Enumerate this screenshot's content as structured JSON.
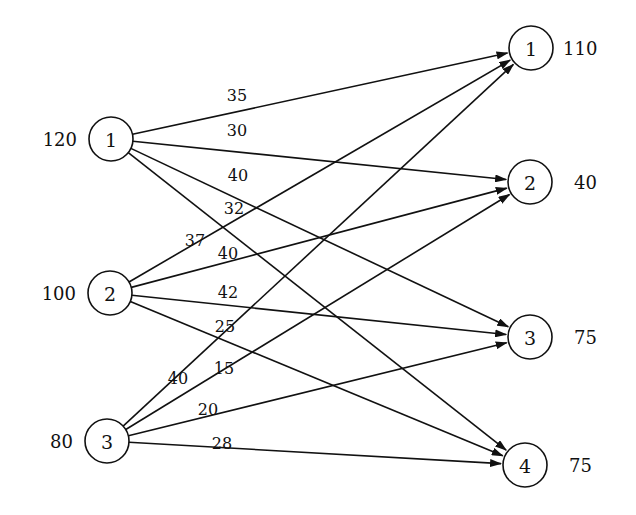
{
  "diagram": {
    "type": "transportation-network",
    "sources": [
      {
        "id": "1",
        "label": "1",
        "supply": "120",
        "x": 111,
        "y": 139
      },
      {
        "id": "2",
        "label": "2",
        "supply": "100",
        "x": 110,
        "y": 293
      },
      {
        "id": "3",
        "label": "3",
        "supply": "80",
        "x": 107,
        "y": 441
      }
    ],
    "destinations": [
      {
        "id": "1",
        "label": "1",
        "demand": "110",
        "x": 531,
        "y": 48
      },
      {
        "id": "2",
        "label": "2",
        "demand": "40",
        "x": 530,
        "y": 182
      },
      {
        "id": "3",
        "label": "3",
        "demand": "75",
        "x": 530,
        "y": 337
      },
      {
        "id": "4",
        "label": "4",
        "demand": "75",
        "x": 525,
        "y": 465
      }
    ],
    "edges": [
      {
        "from": "1",
        "to": "1",
        "cost": "35",
        "lx": 237,
        "ly": 101
      },
      {
        "from": "1",
        "to": "2",
        "cost": "30",
        "lx": 237,
        "ly": 136
      },
      {
        "from": "1",
        "to": "3",
        "cost": "40",
        "lx": 238,
        "ly": 181
      },
      {
        "from": "1",
        "to": "4",
        "cost": "32",
        "lx": 234,
        "ly": 214
      },
      {
        "from": "2",
        "to": "1",
        "cost": "37",
        "lx": 195,
        "ly": 246
      },
      {
        "from": "2",
        "to": "2",
        "cost": "40",
        "lx": 228,
        "ly": 259
      },
      {
        "from": "2",
        "to": "3",
        "cost": "42",
        "lx": 228,
        "ly": 298
      },
      {
        "from": "2",
        "to": "4",
        "cost": "25",
        "lx": 225,
        "ly": 332
      },
      {
        "from": "3",
        "to": "1",
        "cost": "40",
        "lx": 178,
        "ly": 384
      },
      {
        "from": "3",
        "to": "2",
        "cost": "15",
        "lx": 224,
        "ly": 374
      },
      {
        "from": "3",
        "to": "3",
        "cost": "20",
        "lx": 208,
        "ly": 415
      },
      {
        "from": "3",
        "to": "4",
        "cost": "28",
        "lx": 222,
        "ly": 449
      }
    ],
    "node_radius": 22,
    "stroke_color": "#111111",
    "background_color": "#ffffff"
  }
}
